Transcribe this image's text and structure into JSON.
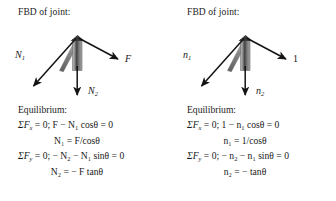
{
  "figure": {
    "background": "#ffffff",
    "ink": "#1a1a1a",
    "member_fill": "#9b9b9b",
    "member_dark": "#4a4a4a"
  },
  "panels": [
    {
      "id": "left",
      "heading": "FBD of joint:",
      "diagram": {
        "labels": {
          "diagonal_force": "N",
          "diagonal_force_sub": "1",
          "applied_force": "F",
          "vertical_force": "N",
          "vertical_force_sub": "2"
        },
        "arrows": [
          {
            "name": "N1",
            "direction": "down-left"
          },
          {
            "name": "F",
            "direction": "down-right"
          },
          {
            "name": "N2",
            "direction": "down"
          }
        ],
        "members": [
          {
            "name": "diagonal-member",
            "orientation": "slanted"
          },
          {
            "name": "vertical-member",
            "orientation": "vertical"
          }
        ]
      },
      "equilibrium": {
        "title": "Equilibrium:",
        "lines": [
          {
            "id": "sum-fx",
            "sigma": "ΣF",
            "sub": "x",
            "rest": " = 0; F − N",
            "var_sub": "1",
            "tail": " cosθ = 0"
          },
          {
            "id": "n1-solved",
            "text": "N₁ = F/cosθ"
          },
          {
            "id": "sum-fy",
            "sigma": "ΣF",
            "sub": "y",
            "rest": " = 0; − N",
            "var_sub": "2",
            "tail": " − N₁ sinθ = 0"
          },
          {
            "id": "n2-solved",
            "text": "N₂ = − F tanθ"
          }
        ]
      }
    },
    {
      "id": "right",
      "heading": "FBD of joint:",
      "diagram": {
        "labels": {
          "diagonal_force": "n",
          "diagonal_force_sub": "1",
          "applied_force": "1",
          "vertical_force": "n",
          "vertical_force_sub": "2"
        },
        "arrows": [
          {
            "name": "n1",
            "direction": "down-left"
          },
          {
            "name": "unit-force",
            "direction": "down-right"
          },
          {
            "name": "n2",
            "direction": "down"
          }
        ],
        "members": [
          {
            "name": "diagonal-member",
            "orientation": "slanted"
          },
          {
            "name": "vertical-member",
            "orientation": "vertical"
          }
        ]
      },
      "equilibrium": {
        "title": "Equilibrium:",
        "lines": [
          {
            "id": "sum-fx",
            "sigma": "ΣF",
            "sub": "x",
            "rest": " = 0; 1 − n",
            "var_sub": "1",
            "tail": " cosθ = 0"
          },
          {
            "id": "n1-solved",
            "text": "n₁ = 1/cosθ"
          },
          {
            "id": "sum-fy",
            "sigma": "ΣF",
            "sub": "y",
            "rest": " = 0; − n",
            "var_sub": "2",
            "tail": " − n₁ sinθ = 0"
          },
          {
            "id": "n2-solved",
            "text": "n₂ = − tanθ"
          }
        ]
      }
    }
  ]
}
